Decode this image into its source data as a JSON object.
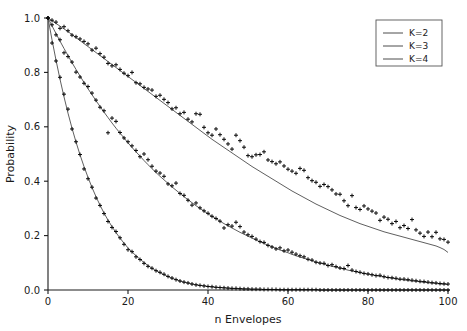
{
  "chart_data": {
    "type": "scatter",
    "title": "",
    "xlabel": "n Envelopes",
    "ylabel": "Probability",
    "xlim": [
      0,
      100
    ],
    "ylim": [
      0.0,
      1.0
    ],
    "grid": false,
    "legend_position": "upper right",
    "xticks": [
      0,
      20,
      40,
      60,
      80,
      100
    ],
    "xtick_labels": [
      "0",
      "20",
      "40",
      "60",
      "80",
      "100"
    ],
    "yticks": [
      0.0,
      0.2,
      0.4,
      0.6,
      0.8,
      1.0
    ],
    "ytick_labels": [
      "0.0",
      "0.2",
      "0.4",
      "0.6",
      "0.8",
      "1.0"
    ],
    "marker": "plus",
    "marker_color": "#0a0a0a",
    "line_color": "#4d4d4d",
    "legend": [
      "K=2",
      "K=3",
      "K=4"
    ],
    "x": [
      0,
      1,
      2,
      3,
      4,
      5,
      6,
      7,
      8,
      9,
      10,
      11,
      12,
      13,
      14,
      15,
      16,
      17,
      18,
      19,
      20,
      21,
      22,
      23,
      24,
      25,
      26,
      27,
      28,
      29,
      30,
      31,
      32,
      33,
      34,
      35,
      36,
      37,
      38,
      39,
      40,
      41,
      42,
      43,
      44,
      45,
      46,
      47,
      48,
      49,
      50,
      51,
      52,
      53,
      54,
      55,
      56,
      57,
      58,
      59,
      60,
      61,
      62,
      63,
      64,
      65,
      66,
      67,
      68,
      69,
      70,
      71,
      72,
      73,
      74,
      75,
      76,
      77,
      78,
      79,
      80,
      81,
      82,
      83,
      84,
      85,
      86,
      87,
      88,
      89,
      90,
      91,
      92,
      93,
      94,
      95,
      96,
      97,
      98,
      99,
      100
    ],
    "series": [
      {
        "name": "K=2",
        "fit_values": [
          1.0,
          0.99,
          0.98,
          0.97,
          0.96,
          0.95,
          0.939,
          0.928,
          0.917,
          0.906,
          0.895,
          0.884,
          0.873,
          0.862,
          0.851,
          0.84,
          0.829,
          0.818,
          0.807,
          0.796,
          0.785,
          0.774,
          0.763,
          0.752,
          0.741,
          0.73,
          0.719,
          0.708,
          0.697,
          0.686,
          0.675,
          0.664,
          0.653,
          0.642,
          0.631,
          0.62,
          0.609,
          0.598,
          0.587,
          0.576,
          0.565,
          0.554,
          0.544,
          0.534,
          0.524,
          0.514,
          0.504,
          0.494,
          0.484,
          0.474,
          0.464,
          0.454,
          0.445,
          0.436,
          0.427,
          0.418,
          0.409,
          0.4,
          0.391,
          0.382,
          0.373,
          0.364,
          0.356,
          0.348,
          0.34,
          0.332,
          0.324,
          0.316,
          0.309,
          0.302,
          0.295,
          0.288,
          0.281,
          0.274,
          0.268,
          0.262,
          0.256,
          0.25,
          0.244,
          0.239,
          0.234,
          0.229,
          0.224,
          0.219,
          0.214,
          0.21,
          0.206,
          0.202,
          0.198,
          0.194,
          0.19,
          0.186,
          0.182,
          0.178,
          0.174,
          0.17,
          0.166,
          0.162,
          0.156,
          0.149,
          0.138
        ],
        "scatter_values": [
          1.0,
          0.992,
          0.985,
          0.962,
          0.968,
          0.953,
          0.937,
          0.931,
          0.923,
          0.914,
          0.905,
          0.882,
          0.889,
          0.869,
          0.856,
          0.833,
          0.824,
          0.828,
          0.811,
          0.797,
          0.788,
          0.8,
          0.762,
          0.758,
          0.745,
          0.739,
          0.735,
          0.712,
          0.716,
          0.701,
          0.689,
          0.666,
          0.67,
          0.648,
          0.653,
          0.628,
          0.618,
          0.648,
          0.646,
          0.598,
          0.578,
          0.569,
          0.592,
          0.571,
          0.554,
          0.537,
          0.518,
          0.569,
          0.549,
          0.525,
          0.494,
          0.49,
          0.497,
          0.498,
          0.508,
          0.478,
          0.472,
          0.464,
          0.471,
          0.456,
          0.444,
          0.437,
          0.429,
          0.447,
          0.44,
          0.413,
          0.402,
          0.396,
          0.381,
          0.388,
          0.38,
          0.368,
          0.353,
          0.352,
          0.328,
          0.31,
          0.347,
          0.303,
          0.296,
          0.309,
          0.298,
          0.29,
          0.283,
          0.256,
          0.268,
          0.26,
          0.244,
          0.252,
          0.229,
          0.237,
          0.226,
          0.259,
          0.221,
          0.209,
          0.197,
          0.213,
          0.196,
          0.212,
          0.188,
          0.186,
          0.176,
          0.172,
          0.18,
          0.16,
          0.155,
          0.148,
          0.141
        ],
        "scatter_x": [
          0,
          1,
          2,
          3,
          4,
          5,
          6,
          7,
          8,
          9,
          10,
          11,
          12,
          13,
          14,
          15,
          16,
          17,
          18,
          19,
          20,
          21,
          22,
          23,
          24,
          25,
          26,
          27,
          28,
          29,
          30,
          31,
          32,
          33,
          34,
          35,
          36,
          37,
          38,
          39,
          40,
          41,
          42,
          43,
          44,
          45,
          46,
          47,
          48,
          49,
          50,
          51,
          52,
          53,
          54,
          55,
          56,
          57,
          58,
          59,
          60,
          61,
          62,
          63,
          64,
          65,
          66,
          67,
          68,
          69,
          70,
          71,
          72,
          73,
          74,
          75,
          76,
          77,
          78,
          79,
          80,
          81,
          82,
          83,
          84,
          85,
          86,
          87,
          88,
          89,
          90,
          91,
          92,
          93,
          94,
          95,
          96,
          97,
          98,
          99,
          100
        ]
      },
      {
        "name": "K=3",
        "fit_values": [
          1.0,
          0.971,
          0.943,
          0.915,
          0.888,
          0.862,
          0.836,
          0.811,
          0.787,
          0.763,
          0.74,
          0.718,
          0.696,
          0.675,
          0.654,
          0.634,
          0.614,
          0.595,
          0.577,
          0.559,
          0.541,
          0.524,
          0.508,
          0.492,
          0.476,
          0.461,
          0.446,
          0.432,
          0.418,
          0.405,
          0.392,
          0.379,
          0.367,
          0.355,
          0.343,
          0.332,
          0.321,
          0.31,
          0.3,
          0.29,
          0.28,
          0.271,
          0.262,
          0.253,
          0.244,
          0.236,
          0.228,
          0.22,
          0.212,
          0.205,
          0.198,
          0.191,
          0.184,
          0.177,
          0.171,
          0.165,
          0.159,
          0.153,
          0.147,
          0.142,
          0.137,
          0.131,
          0.126,
          0.121,
          0.117,
          0.112,
          0.108,
          0.103,
          0.099,
          0.095,
          0.091,
          0.087,
          0.084,
          0.08,
          0.077,
          0.073,
          0.07,
          0.067,
          0.064,
          0.061,
          0.058,
          0.056,
          0.053,
          0.05,
          0.048,
          0.046,
          0.043,
          0.041,
          0.039,
          0.037,
          0.035,
          0.033,
          0.032,
          0.03,
          0.028,
          0.027,
          0.025,
          0.024,
          0.022,
          0.021,
          0.02
        ],
        "scatter_values": [
          1.0,
          0.975,
          0.938,
          0.92,
          0.872,
          0.858,
          0.838,
          0.801,
          0.783,
          0.76,
          0.748,
          0.724,
          0.698,
          0.672,
          0.659,
          0.578,
          0.632,
          0.62,
          0.579,
          0.559,
          0.545,
          0.53,
          0.513,
          0.49,
          0.5,
          0.479,
          0.455,
          0.437,
          0.43,
          0.418,
          0.39,
          0.383,
          0.393,
          0.355,
          0.348,
          0.33,
          0.312,
          0.32,
          0.302,
          0.291,
          0.282,
          0.271,
          0.263,
          0.253,
          0.228,
          0.24,
          0.235,
          0.249,
          0.233,
          0.213,
          0.203,
          0.197,
          0.187,
          0.178,
          0.175,
          0.164,
          0.158,
          0.151,
          0.155,
          0.144,
          0.147,
          0.139,
          0.132,
          0.126,
          0.122,
          0.113,
          0.11,
          0.102,
          0.099,
          0.098,
          0.09,
          0.093,
          0.086,
          0.081,
          0.079,
          0.09,
          0.073,
          0.068,
          0.065,
          0.061,
          0.059,
          0.056,
          0.053,
          0.054,
          0.049,
          0.046,
          0.045,
          0.043,
          0.04,
          0.04,
          0.038,
          0.036,
          0.034,
          0.032,
          0.031,
          0.029,
          0.027,
          0.026,
          0.024,
          0.023,
          0.022
        ],
        "scatter_x": [
          0,
          1,
          2,
          3,
          4,
          5,
          6,
          7,
          8,
          9,
          10,
          11,
          12,
          13,
          14,
          15,
          16,
          17,
          18,
          19,
          20,
          21,
          22,
          23,
          24,
          25,
          26,
          27,
          28,
          29,
          30,
          31,
          32,
          33,
          34,
          35,
          36,
          37,
          38,
          39,
          40,
          41,
          42,
          43,
          44,
          45,
          46,
          47,
          48,
          49,
          50,
          51,
          52,
          53,
          54,
          55,
          56,
          57,
          58,
          59,
          60,
          61,
          62,
          63,
          64,
          65,
          66,
          67,
          68,
          69,
          70,
          71,
          72,
          73,
          74,
          75,
          76,
          77,
          78,
          79,
          80,
          81,
          82,
          83,
          84,
          85,
          86,
          87,
          88,
          89,
          90,
          91,
          92,
          93,
          94,
          95,
          96,
          97,
          98,
          99,
          100
        ]
      },
      {
        "name": "K=4",
        "fit_values": [
          1.0,
          0.92,
          0.845,
          0.775,
          0.71,
          0.65,
          0.595,
          0.544,
          0.497,
          0.454,
          0.414,
          0.377,
          0.343,
          0.312,
          0.283,
          0.257,
          0.233,
          0.211,
          0.191,
          0.172,
          0.155,
          0.14,
          0.126,
          0.113,
          0.101,
          0.09,
          0.08,
          0.071,
          0.063,
          0.056,
          0.049,
          0.043,
          0.038,
          0.033,
          0.029,
          0.025,
          0.022,
          0.019,
          0.017,
          0.015,
          0.013,
          0.011,
          0.01,
          0.009,
          0.008,
          0.007,
          0.006,
          0.005,
          0.004,
          0.004,
          0.003,
          0.003,
          0.003,
          0.002,
          0.002,
          0.002,
          0.002,
          0.001,
          0.001,
          0.001,
          0.001,
          0.001,
          0.001,
          0.001,
          0.001,
          0.001,
          0.001,
          0.001,
          0.0,
          0.0,
          0.0,
          0.0,
          0.0,
          0.0,
          0.0,
          0.0,
          0.0,
          0.0,
          0.0,
          0.0,
          0.0,
          0.0,
          0.0,
          0.0,
          0.0,
          0.0,
          0.0,
          0.0,
          0.0,
          0.0,
          0.0,
          0.0,
          0.0,
          0.0,
          0.0,
          0.0,
          0.0,
          0.0,
          0.0,
          0.0,
          0.0
        ],
        "scatter_values": [
          1.0,
          0.908,
          0.842,
          0.782,
          0.72,
          0.665,
          0.592,
          0.545,
          0.498,
          0.445,
          0.409,
          0.378,
          0.338,
          0.311,
          0.281,
          0.252,
          0.23,
          0.215,
          0.192,
          0.168,
          0.148,
          0.141,
          0.122,
          0.112,
          0.098,
          0.087,
          0.08,
          0.071,
          0.065,
          0.058,
          0.05,
          0.044,
          0.038,
          0.033,
          0.029,
          0.026,
          0.022,
          0.019,
          0.017,
          0.015,
          0.013,
          0.012,
          0.01,
          0.009,
          0.008,
          0.007,
          0.006,
          0.006,
          0.005,
          0.004,
          0.004,
          0.003,
          0.003,
          0.003,
          0.002,
          0.002,
          0.002,
          0.002,
          0.001,
          0.001,
          0.001,
          0.001,
          0.001,
          0.001,
          0.001,
          0.001,
          0.001,
          0.001,
          0.0,
          0.0,
          0.0,
          0.0,
          0.0,
          0.0,
          0.0,
          0.0,
          0.0,
          0.0,
          0.0,
          0.0,
          0.0,
          0.0,
          0.0,
          0.0,
          0.0,
          0.0,
          0.0,
          0.0,
          0.0,
          0.0,
          0.0,
          0.0,
          0.0,
          0.0,
          0.0,
          0.0,
          0.0,
          0.0,
          0.0,
          0.0,
          0.0
        ],
        "scatter_x": [
          0,
          1,
          2,
          3,
          4,
          5,
          6,
          7,
          8,
          9,
          10,
          11,
          12,
          13,
          14,
          15,
          16,
          17,
          18,
          19,
          20,
          21,
          22,
          23,
          24,
          25,
          26,
          27,
          28,
          29,
          30,
          31,
          32,
          33,
          34,
          35,
          36,
          37,
          38,
          39,
          40,
          41,
          42,
          43,
          44,
          45,
          46,
          47,
          48,
          49,
          50,
          51,
          52,
          53,
          54,
          55,
          56,
          57,
          58,
          59,
          60,
          61,
          62,
          63,
          64,
          65,
          66,
          67,
          68,
          69,
          70,
          71,
          72,
          73,
          74,
          75,
          76,
          77,
          78,
          79,
          80,
          81,
          82,
          83,
          84,
          85,
          86,
          87,
          88,
          89,
          90,
          91,
          92,
          93,
          94,
          95,
          96,
          97,
          98,
          99,
          100
        ]
      }
    ]
  }
}
